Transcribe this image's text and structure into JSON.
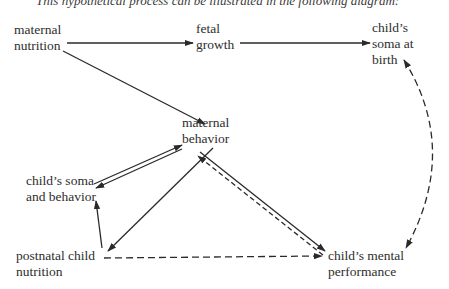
{
  "caption_fragment": "This hypothetical process can be illustrated in the following diagram:",
  "nodes": {
    "maternal_nutrition": {
      "line1": "maternal",
      "line2": "nutrition"
    },
    "fetal_growth": {
      "line1": "fetal",
      "line2": "growth"
    },
    "soma_at_birth": {
      "line1": "child’s",
      "line2": "soma at",
      "line3": "birth"
    },
    "maternal_behavior": {
      "line1": "maternal",
      "line2": "behavior"
    },
    "soma_behavior": {
      "line1": "child’s soma",
      "line2": "and behavior"
    },
    "postnatal_nutrition": {
      "line1": "postnatal child",
      "line2": "nutrition"
    },
    "mental_performance": {
      "line1": "child’s mental",
      "line2": "performance"
    }
  },
  "edges": [
    {
      "from": "maternal nutrition",
      "to": "fetal growth",
      "style": "solid"
    },
    {
      "from": "fetal growth",
      "to": "child's soma at birth",
      "style": "solid"
    },
    {
      "from": "maternal nutrition",
      "to": "maternal behavior",
      "style": "solid"
    },
    {
      "from": "maternal behavior",
      "to": "child's soma and behavior",
      "style": "solid"
    },
    {
      "from": "child's soma and behavior",
      "to": "maternal behavior",
      "style": "solid"
    },
    {
      "from": "maternal behavior",
      "to": "postnatal child nutrition",
      "style": "solid"
    },
    {
      "from": "postnatal child nutrition",
      "to": "child's soma and behavior",
      "style": "solid"
    },
    {
      "from": "maternal behavior",
      "to": "child's mental performance",
      "style": "solid"
    },
    {
      "from": "child's mental performance",
      "to": "maternal behavior",
      "style": "dashed"
    },
    {
      "from": "postnatal child nutrition",
      "to": "child's mental performance",
      "style": "dashed"
    },
    {
      "from": "child's soma at birth",
      "to": "child's mental performance",
      "style": "dashed",
      "bidirectional": true
    }
  ],
  "colors": {
    "ink": "#2a2a2a",
    "background": "#ffffff"
  }
}
